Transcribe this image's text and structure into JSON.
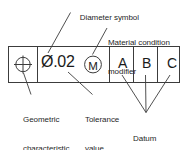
{
  "diagram": {
    "frame": {
      "name": "feature-control-frame",
      "cells": [
        {
          "id": "geometric-characteristic",
          "symbol": "position-symbol",
          "text": ""
        },
        {
          "id": "tolerance-zone",
          "symbol": "diameter-symbol",
          "text": "Ø.02"
        },
        {
          "id": "datum-a",
          "symbol": "",
          "text": "A"
        },
        {
          "id": "datum-b",
          "symbol": "",
          "text": "B"
        },
        {
          "id": "datum-c",
          "symbol": "",
          "text": "C"
        }
      ],
      "tolerance_text": "Ø.02",
      "modifier_letter": "M",
      "datum_letters": [
        "A",
        "B",
        "C"
      ]
    },
    "callouts": [
      {
        "id": "diameter-symbol",
        "text": "Diameter symbol",
        "position": "top-left",
        "points_to": "diameter-symbol-glyph"
      },
      {
        "id": "material-condition-modifier",
        "text": "Material condition\nmodifier",
        "line1": "Material condition",
        "line2": "modifier",
        "position": "top-right",
        "points_to": "circled-m-symbol"
      },
      {
        "id": "geometric-characteristic-symbol",
        "text": "Geometric\ncharacteristic\nsymbol",
        "line1": "Geometric",
        "line2": "characteristic",
        "line3": "symbol",
        "position": "bottom-left",
        "points_to": "position-symbol"
      },
      {
        "id": "tolerance-value",
        "text": "Tolerance\nvalue",
        "line1": "Tolerance",
        "line2": "value",
        "position": "bottom-center",
        "points_to": "tolerance-text"
      },
      {
        "id": "datum-reference-letters",
        "text": "Datum\nreference\nletters",
        "line1": "Datum",
        "line2": "reference",
        "line3": "letters",
        "position": "bottom-right",
        "points_to": "datum-letters"
      }
    ],
    "colors": {
      "stroke": "#3c3c3c",
      "text": "#1f1f1f",
      "background": "#ffffff"
    }
  }
}
